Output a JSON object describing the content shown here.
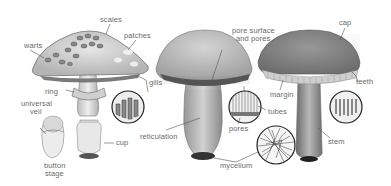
{
  "diagram": {
    "style": "grayscale illustration",
    "specimens": [
      {
        "name": "gilled mushroom (Amanita type)",
        "labels": {
          "scales": "scales",
          "warts": "warts",
          "patches": "patches",
          "gills": "gills",
          "ring": "ring",
          "universal_veil": "universal",
          "universal_veil_2": "veil",
          "cup": "cup",
          "button_stage": "button",
          "button_stage_2": "stage"
        }
      },
      {
        "name": "bolete (pored mushroom)",
        "labels": {
          "pore_surface": "pore surface",
          "pore_surface_2": "and pores",
          "reticulation": "reticulation",
          "tubes": "tubes",
          "pores": "pores",
          "mycelium": "mycelium"
        }
      },
      {
        "name": "toothed mushroom (hedgehog type)",
        "labels": {
          "cap": "cap",
          "margin": "margin",
          "teeth": "teeth",
          "stem": "stem"
        }
      }
    ],
    "insets": [
      "gills-detail",
      "tubes-and-pores-detail",
      "mycelium-detail",
      "teeth-detail"
    ],
    "colors": {
      "background": "#ffffff",
      "label_text": "#6a6a6a",
      "leader_line": "#555555",
      "cap_light": "#d8d8d8",
      "cap_dark": "#8a8a8a",
      "outline": "#3a3a3a"
    }
  }
}
